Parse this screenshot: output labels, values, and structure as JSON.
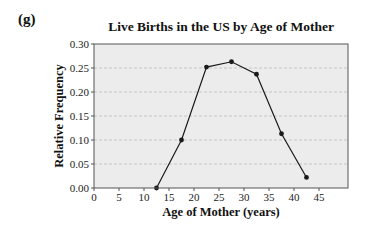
{
  "panel_label": "(g)",
  "chart_data": {
    "type": "line",
    "title": "Live Births in the US by Age of Mother",
    "xlabel": "Age of Mother (years)",
    "ylabel": "Relative Frequency",
    "x": [
      12.5,
      17.5,
      22.5,
      27.5,
      32.5,
      37.5,
      42.5
    ],
    "values": [
      0.0,
      0.1,
      0.252,
      0.263,
      0.237,
      0.113,
      0.022
    ],
    "xlim": [
      0,
      50.8
    ],
    "ylim": [
      0,
      0.3
    ],
    "xticks": [
      0,
      5,
      10,
      15,
      20,
      25,
      30,
      35,
      40,
      45
    ],
    "yticks": [
      "0.00",
      "0.05",
      "0.10",
      "0.15",
      "0.20",
      "0.25",
      "0.30"
    ],
    "grid": "horizontal dashed",
    "markers": true,
    "legend": null
  },
  "colors": {
    "plot_background": "#ececec",
    "line": "#1a1a1a",
    "grid": "#bdbdbd",
    "frame": "#555555"
  }
}
